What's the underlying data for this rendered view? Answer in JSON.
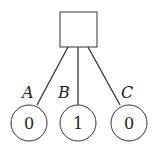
{
  "root": {
    "shape": "square"
  },
  "edges": [
    {
      "label": "A"
    },
    {
      "label": "B"
    },
    {
      "label": "C"
    }
  ],
  "leaves": [
    {
      "value": "0"
    },
    {
      "value": "1"
    },
    {
      "value": "0"
    }
  ],
  "colors": {
    "stroke": "#333333"
  }
}
